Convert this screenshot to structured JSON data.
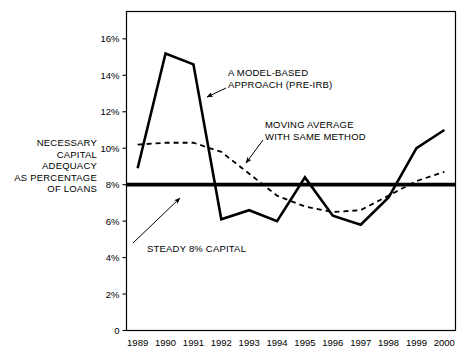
{
  "chart_data": {
    "type": "line",
    "title": "",
    "xlabel": "",
    "ylabel": "NECESSARY CAPITAL ADEQUACY AS PERCENTAGE OF LOANS",
    "ylabel_lines": [
      "NECESSARY",
      "CAPITAL",
      "ADEQUACY",
      "AS PERCENTAGE",
      "OF LOANS"
    ],
    "categories": [
      "1989",
      "1990",
      "1991",
      "1992",
      "1993",
      "1994",
      "1995",
      "1996",
      "1997",
      "1998",
      "1999",
      "2000"
    ],
    "x": [
      1989,
      1990,
      1991,
      1992,
      1993,
      1994,
      1995,
      1996,
      1997,
      1998,
      1999,
      2000
    ],
    "ylim": [
      0,
      17.5
    ],
    "xlim": [
      1988.6,
      2000.4
    ],
    "yticks": [
      0,
      2,
      4,
      6,
      8,
      10,
      12,
      14,
      16
    ],
    "ytick_labels": [
      "0",
      "2%",
      "4%",
      "6%",
      "8%",
      "10%",
      "12%",
      "14%",
      "16%"
    ],
    "grid": false,
    "legend": "none",
    "series": [
      {
        "name": "A MODEL-BASED APPROACH (PRE-IRB)",
        "style": "solid",
        "color": "#000000",
        "width": 2.6,
        "values": [
          8.9,
          15.2,
          14.6,
          6.1,
          6.6,
          6.0,
          8.4,
          6.3,
          5.8,
          7.3,
          10.0,
          11.0
        ]
      },
      {
        "name": "MOVING AVERAGE WITH SAME METHOD",
        "style": "dashed",
        "color": "#000000",
        "width": 1.8,
        "values": [
          10.2,
          10.3,
          10.3,
          9.8,
          8.6,
          7.4,
          6.8,
          6.5,
          6.6,
          7.4,
          8.2,
          8.7
        ]
      },
      {
        "name": "STEADY 8% CAPITAL",
        "style": "solid-thick",
        "color": "#000000",
        "width": 3.6,
        "constant": 8.0
      }
    ],
    "annotations": [
      {
        "id": "model-based",
        "lines": [
          "A MODEL-BASED",
          "APPROACH (PRE-IRB)"
        ],
        "text_x": 228,
        "text_y": 76,
        "arrow_from_x": 226,
        "arrow_from_y": 88,
        "arrow_to_x": 207,
        "arrow_to_y": 97
      },
      {
        "id": "moving-average",
        "lines": [
          "MOVING AVERAGE",
          "WITH SAME METHOD"
        ],
        "text_x": 265,
        "text_y": 128,
        "arrow_from_x": 263,
        "arrow_from_y": 140,
        "arrow_to_x": 246,
        "arrow_to_y": 163
      },
      {
        "id": "steady-8",
        "lines": [
          "STEADY 8% CAPITAL"
        ],
        "text_x": 147,
        "text_y": 252,
        "arrow_from_x": 133,
        "arrow_from_y": 243,
        "arrow_to_x": 180,
        "arrow_to_y": 198
      }
    ],
    "axis_frame": {
      "left": 126.5,
      "right": 455.5,
      "top": 11.5,
      "bottom": 330.5,
      "stroke": "#000000",
      "stroke_width": 1.2
    },
    "colors": {
      "background": "#ffffff",
      "ink": "#000000"
    }
  }
}
